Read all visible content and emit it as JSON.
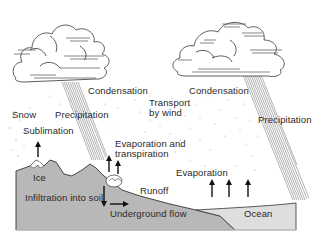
{
  "diagram": {
    "labels": {
      "condensation_left": "Condensation",
      "snow": "Snow",
      "precipitation_left": "Precipitation",
      "sublimation": "Sublimation",
      "evap_transp_line1": "Evaporation and",
      "evap_transp_line2": "transpiration",
      "ice": "Ice",
      "infiltration": "Infiltration into soil",
      "runoff": "Runoff",
      "underground_flow": "Underground flow",
      "transport_line1": "Transport",
      "transport_line2": "by wind",
      "condensation_right": "Condensation",
      "precipitation_right": "Precipitation",
      "evaporation": "Evaporation",
      "ocean": "Ocean"
    },
    "colors": {
      "land": "#b4b4b4",
      "ocean": "#dcdcdc",
      "outline": "#333333",
      "rain": "#555555",
      "vapor_dots": "#9a9a9a"
    }
  }
}
